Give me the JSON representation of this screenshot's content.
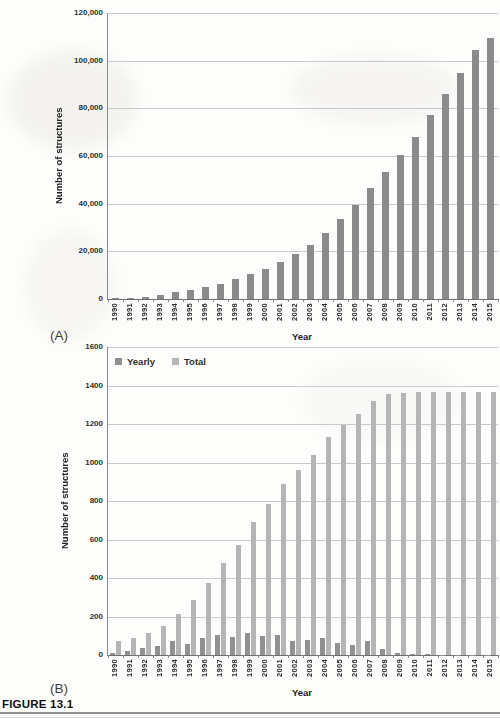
{
  "figure": {
    "caption": "FIGURE 13.1",
    "panel_a_label": "(A)",
    "panel_b_label": "(B)"
  },
  "chart_data": [
    {
      "id": "A",
      "type": "bar",
      "title": "",
      "xlabel": "Year",
      "ylabel": "Number of structures",
      "ylim": [
        0,
        120000
      ],
      "ytick_step": 20000,
      "ytick_labels": [
        "0",
        "20,000",
        "40,000",
        "60,000",
        "80,000",
        "100,000",
        "120,000"
      ],
      "grid": true,
      "bar_color": "#8b8b8b",
      "categories": [
        "1990",
        "1991",
        "1992",
        "1993",
        "1994",
        "1995",
        "1996",
        "1997",
        "1998",
        "1999",
        "2000",
        "2001",
        "2002",
        "2003",
        "2004",
        "2005",
        "2006",
        "2007",
        "2008",
        "2009",
        "2010",
        "2011",
        "2012",
        "2013",
        "2014",
        "2015"
      ],
      "values": [
        300,
        450,
        700,
        1600,
        2800,
        3800,
        5100,
        6300,
        8500,
        10500,
        12500,
        15500,
        18800,
        22500,
        27500,
        33500,
        39500,
        46500,
        53500,
        60500,
        68000,
        77000,
        86000,
        95000,
        104500,
        109500
      ]
    },
    {
      "id": "B",
      "type": "bar",
      "title": "",
      "xlabel": "Year",
      "ylabel": "Number of structures",
      "ylim": [
        0,
        1600
      ],
      "ytick_step": 200,
      "ytick_labels": [
        "0",
        "200",
        "400",
        "600",
        "800",
        "1000",
        "1200",
        "1400",
        "1600"
      ],
      "grid": true,
      "legend_position": "top-left-inside",
      "categories": [
        "1990",
        "1991",
        "1992",
        "1993",
        "1994",
        "1995",
        "1996",
        "1997",
        "1998",
        "1999",
        "2000",
        "2001",
        "2002",
        "2003",
        "2004",
        "2005",
        "2006",
        "2007",
        "2008",
        "2009",
        "2010",
        "2011",
        "2012",
        "2013",
        "2014",
        "2015"
      ],
      "series": [
        {
          "name": "Yearly",
          "color": "#919191",
          "values": [
            12,
            22,
            38,
            47,
            72,
            58,
            87,
            104,
            95,
            113,
            100,
            104,
            74,
            80,
            88,
            60,
            52,
            74,
            32,
            10,
            4,
            3,
            2,
            2,
            2,
            2
          ]
        },
        {
          "name": "Total",
          "color": "#b5b5b5",
          "values": [
            75,
            90,
            113,
            150,
            215,
            288,
            372,
            480,
            570,
            690,
            785,
            890,
            960,
            1040,
            1130,
            1195,
            1250,
            1320,
            1355,
            1363,
            1365,
            1365,
            1365,
            1365,
            1365,
            1365
          ]
        }
      ]
    }
  ]
}
